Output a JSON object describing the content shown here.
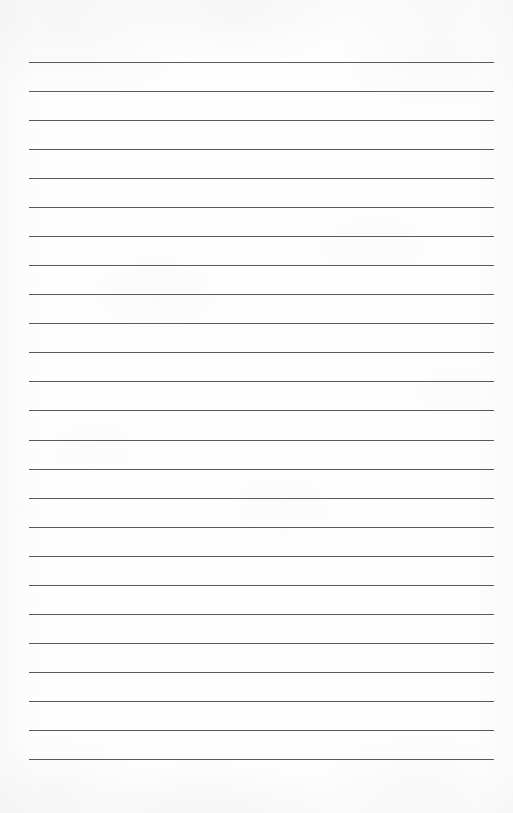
{
  "document": {
    "kind": "lined-paper-scan",
    "description": "Blank sheet of ruled notebook paper, scanned",
    "text_content": "",
    "page_width_px": 513,
    "page_height_px": 813,
    "background_color": "#fdfdfd",
    "paper_tone": "off-white"
  },
  "ruling": {
    "line_color": "#4a4a50",
    "line_thickness_px": 1,
    "line_count": 25,
    "line_left_px": 29,
    "line_right_px": 494,
    "line_width_px": 465,
    "first_line_y_px": 62,
    "last_line_y_px": 759,
    "line_spacing_px": 29.04,
    "margins": {
      "top_px": 62,
      "bottom_px": 54,
      "left_px": 29,
      "right_px": 19
    },
    "line_y_positions": [
      62,
      91,
      120,
      149,
      178,
      207,
      236,
      265,
      294,
      323,
      352,
      381,
      410,
      440,
      469,
      498,
      527,
      556,
      585,
      614,
      643,
      672,
      701,
      730,
      759
    ]
  }
}
